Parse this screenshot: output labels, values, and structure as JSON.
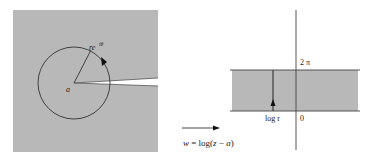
{
  "figure": {
    "z_plane": {
      "center_label": "a",
      "point_label_base": "re",
      "point_label_exp": "iθ",
      "region_fill": "#b8b8b8"
    },
    "mapping": {
      "label_w": "w",
      "label_eq": " = log(",
      "label_z": "z",
      "label_minus": " − ",
      "label_a": "a",
      "label_close": ")"
    },
    "w_plane": {
      "top_label": "2 π",
      "origin_label": "0",
      "segment_label": "log r",
      "region_fill": "#b8b8b8"
    },
    "colors": {
      "background": "#ffffff",
      "region": "#b8b8b8",
      "line": "#333333"
    }
  }
}
